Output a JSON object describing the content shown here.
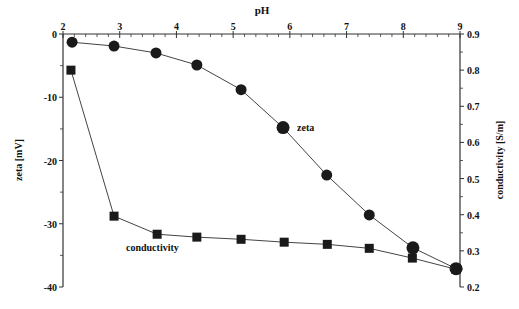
{
  "chart_data": {
    "type": "line",
    "title": "",
    "xlabel": "pH",
    "ylabel": "zeta [mV]",
    "y2label": "conductivity [S/m]",
    "xlim": [
      2,
      9
    ],
    "ylim": [
      -40,
      0
    ],
    "y2lim": [
      0.2,
      0.9
    ],
    "x_ticks": [
      "2",
      "3",
      "4",
      "5",
      "6",
      "7",
      "8",
      "9"
    ],
    "y_ticks": [
      "0",
      "-10",
      "-20",
      "-30",
      "-40"
    ],
    "y2_ticks": [
      "0.9",
      "0.8",
      "0.7",
      "0.6",
      "0.5",
      "0.4",
      "0.3",
      "0.2"
    ],
    "x_axis_position": "top",
    "grid": false,
    "legend": "inline labels",
    "series": [
      {
        "name": "zeta",
        "axis": "left",
        "marker": "circle",
        "x": [
          2.16,
          2.9,
          3.64,
          4.36,
          5.14,
          5.88,
          6.65,
          7.4,
          8.17,
          8.93
        ],
        "values": [
          -1.3,
          -1.9,
          -3.0,
          -4.9,
          -8.8,
          -14.8,
          -22.3,
          -28.6,
          -33.8,
          -37.1
        ]
      },
      {
        "name": "conductivity",
        "axis": "right",
        "marker": "square",
        "x": [
          2.14,
          2.9,
          3.66,
          4.36,
          5.14,
          5.9,
          6.66,
          7.4,
          8.16,
          8.93
        ],
        "values": [
          0.8,
          0.396,
          0.346,
          0.338,
          0.332,
          0.324,
          0.318,
          0.307,
          0.28,
          0.249
        ]
      }
    ],
    "annotations": [
      {
        "text": "zeta",
        "x": 6.2,
        "y": -14.8
      },
      {
        "text": "conductivity",
        "x": 2.8,
        "y_right": 0.33
      }
    ]
  },
  "labels": {
    "xlabel": "pH",
    "ylabel": "zeta [mV]",
    "y2label": "conductivity [S/m]",
    "zeta_annotation": "zeta",
    "conductivity_annotation": "conductivity"
  }
}
